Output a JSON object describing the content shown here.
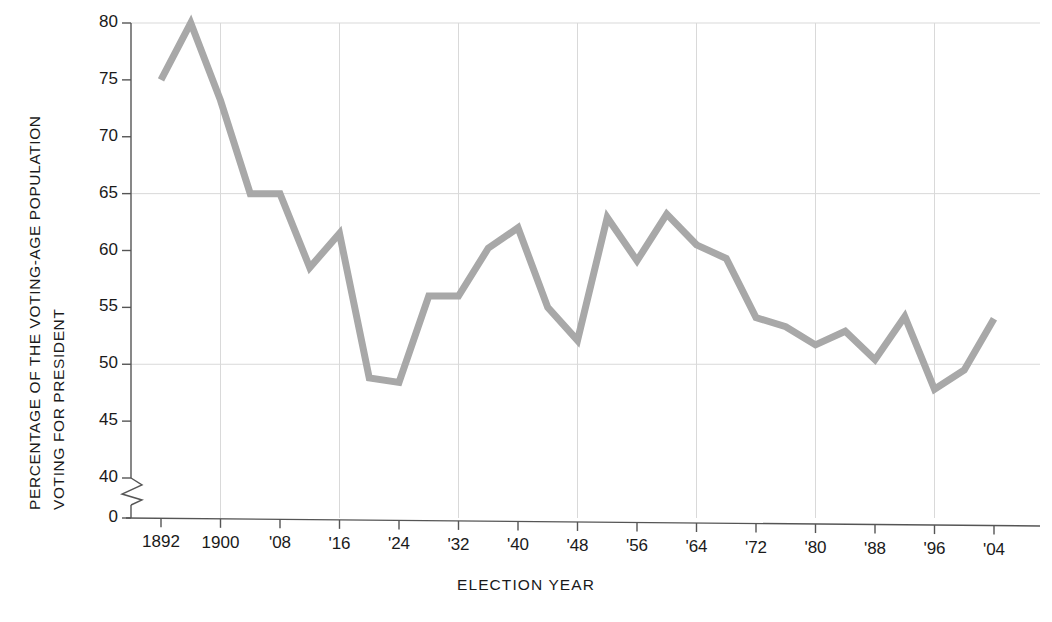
{
  "chart_data": {
    "type": "line",
    "title": "",
    "xlabel": "ELECTION YEAR",
    "ylabel": "PERCENTAGE OF THE VOTING-AGE POPULATION VOTING FOR PRESIDENT",
    "ylabel_line1": "PERCENTAGE OF THE VOTING-AGE POPULATION",
    "ylabel_line2": "VOTING FOR PRESIDENT",
    "grid": true,
    "legend": "none",
    "axis_break": true,
    "axis_break_note": "y-axis broken between 40 and 0",
    "ylim": [
      38,
      80
    ],
    "ytick_values": [
      80,
      75,
      70,
      65,
      60,
      55,
      50,
      45,
      40,
      0
    ],
    "ytick_labels": [
      "80",
      "75",
      "70",
      "65",
      "60",
      "55",
      "50",
      "45",
      "40",
      "0"
    ],
    "gridline_values": [
      80,
      65,
      50
    ],
    "xlim": [
      1892,
      2004
    ],
    "xtick_values": [
      1892,
      1900,
      1908,
      1916,
      1924,
      1932,
      1940,
      1948,
      1956,
      1964,
      1972,
      1980,
      1988,
      1996,
      2004
    ],
    "xtick_labels": [
      "1892",
      "1900",
      "'08",
      "'16",
      "'24",
      "'32",
      "'40",
      "'48",
      "'56",
      "'64",
      "'72",
      "'80",
      "'88",
      "'96",
      "'04"
    ],
    "x_gridline_values": [
      1900,
      1916,
      1932,
      1948,
      1964,
      1980,
      1996
    ],
    "line_color": "#a8a8a8",
    "line_width": 7,
    "x": [
      1892,
      1896,
      1900,
      1904,
      1908,
      1912,
      1916,
      1920,
      1924,
      1928,
      1932,
      1936,
      1940,
      1944,
      1948,
      1952,
      1956,
      1960,
      1964,
      1968,
      1972,
      1976,
      1980,
      1984,
      1988,
      1992,
      1996,
      2000,
      2004
    ],
    "values": [
      75.0,
      80.0,
      73.2,
      65.0,
      65.0,
      58.5,
      61.5,
      48.8,
      48.4,
      56.0,
      56.0,
      60.2,
      62.0,
      55.0,
      52.1,
      62.9,
      59.1,
      63.2,
      60.5,
      59.3,
      54.1,
      53.3,
      51.7,
      52.9,
      50.4,
      54.2,
      47.8,
      49.5,
      54.0
    ]
  }
}
